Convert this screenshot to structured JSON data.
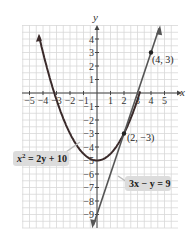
{
  "chart_data": {
    "type": "line",
    "title": "",
    "xlabel": "x",
    "ylabel": "y",
    "xlim": [
      -5.5,
      5.7
    ],
    "ylim": [
      -9.9,
      5
    ],
    "grid": true,
    "x_ticks": [
      "−5",
      "−4",
      "−3",
      "−2",
      "−1",
      "1",
      "2",
      "3",
      "4",
      "5"
    ],
    "y_ticks": [
      "4",
      "3",
      "2",
      "1",
      "−1",
      "−2",
      "−3",
      "−4",
      "−5",
      "−6",
      "−7",
      "−8",
      "−9"
    ],
    "series": [
      {
        "name": "x² = 2y + 10",
        "kind": "parabola",
        "vertex": [
          0,
          -5
        ],
        "color": "#3a2a2a"
      },
      {
        "name": "3x − y = 9",
        "kind": "line",
        "slope": 3,
        "intercept": -9,
        "color": "#555555"
      }
    ],
    "points": [
      {
        "label": "(4, 3)",
        "x": 4,
        "y": 3
      },
      {
        "label": "(2, −3)",
        "x": 2,
        "y": -3
      }
    ],
    "annotations": [
      {
        "text": "x² = 2y + 10",
        "target": "parabola"
      },
      {
        "text": "3x − y = 9",
        "target": "line"
      }
    ]
  },
  "labels": {
    "x_axis": "x",
    "y_axis": "y",
    "point1": "(4, 3)",
    "point2": "(2, −3)",
    "eq_parabola_base": "x",
    "eq_parabola_exp": "2",
    "eq_parabola_rest": " = 2y + 10",
    "eq_line": "3x − y = 9"
  }
}
